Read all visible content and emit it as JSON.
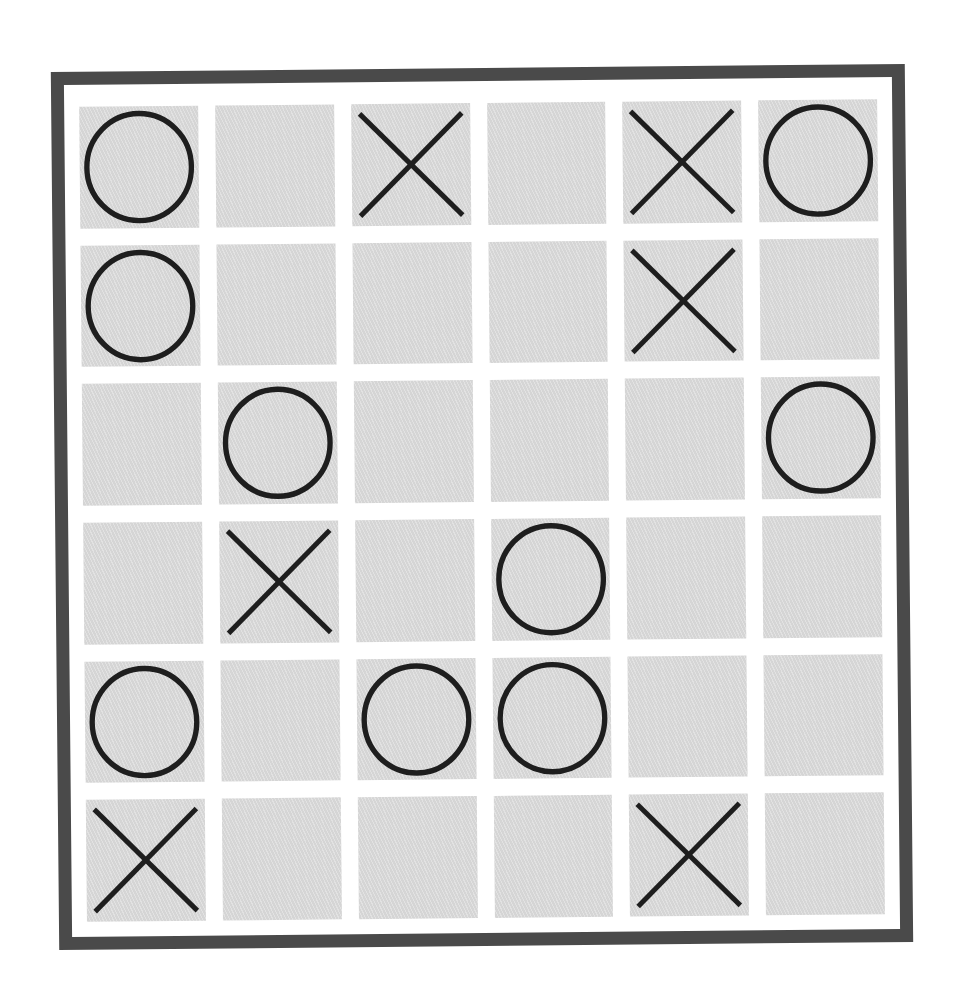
{
  "game": {
    "type": "tic-tac-toe",
    "rows": 6,
    "cols": 6,
    "board": [
      [
        "O",
        "",
        "X",
        "",
        "X",
        "O"
      ],
      [
        "O",
        "",
        "",
        "",
        "X",
        ""
      ],
      [
        "",
        "O",
        "",
        "",
        "",
        "O"
      ],
      [
        "",
        "X",
        "",
        "O",
        "",
        ""
      ],
      [
        "O",
        "",
        "O",
        "O",
        "",
        ""
      ],
      [
        "X",
        "",
        "",
        "",
        "X",
        ""
      ]
    ],
    "counts": {
      "X": 7,
      "O": 10,
      "empty": 19
    }
  },
  "colors": {
    "frame": "#4a4a4a",
    "board_background": "#ffffff",
    "cell": "#dcdcdc",
    "mark": "#1e1e1e"
  },
  "icons": {
    "X": "x-mark-icon",
    "O": "o-mark-icon"
  }
}
